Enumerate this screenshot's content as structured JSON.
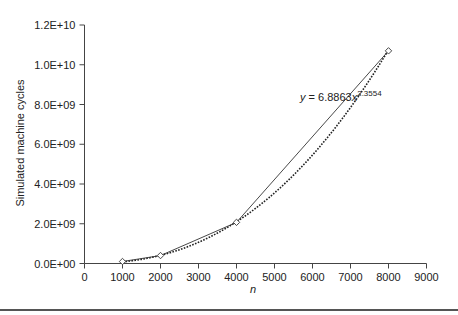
{
  "chart_data": {
    "type": "scatter",
    "title": "",
    "xlabel": "n",
    "ylabel": "Simulated machine cycles",
    "xlim": [
      0,
      9000
    ],
    "ylim": [
      0,
      12000000000
    ],
    "x_ticks": [
      0,
      1000,
      2000,
      3000,
      4000,
      5000,
      6000,
      7000,
      8000,
      9000
    ],
    "x_tick_labels": [
      "0",
      "1000",
      "2000",
      "3000",
      "4000",
      "5000",
      "6000",
      "7000",
      "8000",
      "9000"
    ],
    "y_ticks": [
      0,
      2000000000,
      4000000000,
      6000000000,
      8000000000,
      10000000000,
      12000000000
    ],
    "y_tick_labels": [
      "0.0E+00",
      "2.0E+09",
      "4.0E+09",
      "6.0E+09",
      "8.0E+09",
      "1.0E+10",
      "1.2E+10"
    ],
    "grid": false,
    "legend": null,
    "series": [
      {
        "name": "measured",
        "style": "solid line with diamond markers",
        "x": [
          1000,
          2000,
          4000,
          8000
        ],
        "y": [
          100000000,
          400000000,
          2070000000,
          10700000000
        ]
      },
      {
        "name": "power trendline",
        "style": "dotted",
        "equation": "y = 6.8863x^2.3554",
        "coefficient": 6.8863,
        "exponent": 2.3554,
        "x_range": [
          1000,
          8000
        ]
      }
    ],
    "annotations": [
      {
        "text_prefix": "y = 6.8863x",
        "superscript": "2.3554",
        "x": 4600,
        "y": 9400000000
      }
    ]
  }
}
